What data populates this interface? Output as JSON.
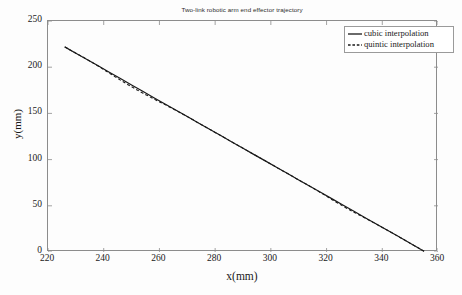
{
  "chart_data": {
    "type": "line",
    "title": "Two-link robotic arm end effector trajectory",
    "xlabel": "x(mm)",
    "ylabel": "y(mm)",
    "xlim": [
      220,
      360
    ],
    "ylim": [
      0,
      250
    ],
    "xticks": [
      220,
      240,
      260,
      280,
      300,
      320,
      340,
      360
    ],
    "yticks": [
      0,
      50,
      100,
      150,
      200,
      250
    ],
    "xtick_labels": [
      "220",
      "240",
      "260",
      "280",
      "300",
      "320",
      "340",
      "360"
    ],
    "ytick_labels": [
      "0",
      "50",
      "100",
      "150",
      "200",
      "250"
    ],
    "grid": false,
    "box": true,
    "legend_position": "upper right",
    "series": [
      {
        "name": "cubic interpolation",
        "style": "solid",
        "color": "#1a1a1a",
        "x": [
          226.0,
          230.0,
          234.0,
          238.0,
          242.0,
          246.0,
          250.0,
          254.0,
          258.0,
          262.0,
          266.0,
          270.0,
          274.0,
          278.0,
          282.0,
          286.0,
          290.0,
          294.0,
          298.0,
          302.0,
          306.0,
          310.0,
          314.0,
          318.0,
          322.0,
          326.0,
          330.0,
          334.0,
          338.0,
          342.0,
          346.0,
          350.0,
          355.0
        ],
        "y": [
          222.0,
          215.2,
          208.4,
          201.5,
          194.6,
          187.7,
          180.8,
          173.9,
          167.0,
          160.2,
          153.4,
          146.6,
          139.7,
          132.8,
          126.0,
          119.1,
          112.3,
          105.4,
          98.6,
          91.7,
          84.9,
          78.0,
          71.2,
          64.3,
          57.5,
          50.6,
          43.8,
          36.9,
          30.1,
          23.2,
          16.4,
          9.5,
          0.8
        ]
      },
      {
        "name": "quintic interpolation",
        "style": "dashed",
        "color": "#1a1a1a",
        "x": [
          226.0,
          230.0,
          234.0,
          238.0,
          242.0,
          246.0,
          250.0,
          254.0,
          258.0,
          262.0,
          266.0,
          270.0,
          274.0,
          278.0,
          282.0,
          286.0,
          290.0,
          294.0,
          298.0,
          302.0,
          306.0,
          310.0,
          314.0,
          318.0,
          322.0,
          326.0,
          330.0,
          334.0,
          338.0,
          342.0,
          346.0,
          350.0,
          355.0
        ],
        "y": [
          222.0,
          215.2,
          208.4,
          201.3,
          193.6,
          186.0,
          178.8,
          172.0,
          165.6,
          159.5,
          153.1,
          146.5,
          139.7,
          132.8,
          126.0,
          119.1,
          112.3,
          105.4,
          98.6,
          91.7,
          84.9,
          78.0,
          71.2,
          64.0,
          56.6,
          49.4,
          42.8,
          36.5,
          30.0,
          23.2,
          16.4,
          9.5,
          0.8
        ]
      }
    ]
  },
  "legend": {
    "entries": [
      {
        "label": "cubic interpolation",
        "style": "solid"
      },
      {
        "label": "quintic interpolation",
        "style": "dashed"
      }
    ]
  }
}
